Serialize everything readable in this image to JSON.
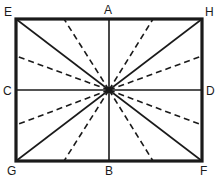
{
  "diagram": {
    "colors": {
      "stroke": "#1a1a1a",
      "background": "#ffffff"
    },
    "labels": {
      "E": "E",
      "A": "A",
      "H": "H",
      "C": "C",
      "D": "D",
      "G": "G",
      "B": "B",
      "F": "F"
    },
    "points": {
      "E": [
        16,
        19
      ],
      "A": [
        109,
        19
      ],
      "H": [
        202,
        19
      ],
      "C": [
        16,
        90
      ],
      "D": [
        202,
        90
      ],
      "G": [
        16,
        161
      ],
      "B": [
        109,
        161
      ],
      "F": [
        202,
        161
      ],
      "center": [
        109,
        90
      ]
    },
    "solid_lines": [
      [
        "E",
        "F"
      ],
      [
        "H",
        "G"
      ],
      [
        "A",
        "B"
      ],
      [
        "C",
        "D"
      ]
    ],
    "dashed_line_endpoints": [
      [
        64,
        19
      ],
      [
        153,
        19
      ],
      [
        64,
        161
      ],
      [
        153,
        161
      ],
      [
        16,
        56
      ],
      [
        16,
        125
      ],
      [
        202,
        56
      ],
      [
        202,
        125
      ]
    ]
  }
}
